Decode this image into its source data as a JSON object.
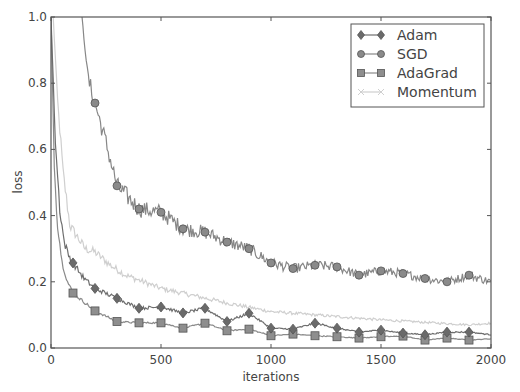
{
  "chart_data": {
    "type": "line",
    "title": "",
    "xlabel": "iterations",
    "ylabel": "loss",
    "xlim": [
      0,
      2000
    ],
    "ylim": [
      0.0,
      1.0
    ],
    "grid": false,
    "legend_position": "upper right",
    "x_ticks": [
      "0",
      "500",
      "1000",
      "1500",
      "2000"
    ],
    "y_ticks": [
      "0.0",
      "0.2",
      "0.4",
      "0.6",
      "0.8",
      "1.0"
    ],
    "marker_every": 100,
    "series": [
      {
        "name": "Adam",
        "marker": "diamond",
        "color": "#6e6e6e",
        "x": [
          0,
          20,
          40,
          60,
          80,
          100,
          150,
          200,
          300,
          400,
          500,
          600,
          700,
          800,
          900,
          1000,
          1100,
          1200,
          1300,
          1400,
          1500,
          1600,
          1700,
          1800,
          1900,
          2000
        ],
        "values": [
          1.0,
          0.62,
          0.42,
          0.32,
          0.28,
          0.257,
          0.21,
          0.18,
          0.15,
          0.12,
          0.124,
          0.106,
          0.12,
          0.08,
          0.105,
          0.06,
          0.057,
          0.075,
          0.06,
          0.048,
          0.054,
          0.045,
          0.04,
          0.048,
          0.048,
          0.04
        ]
      },
      {
        "name": "SGD",
        "marker": "circle",
        "color": "#878787",
        "x": [
          140,
          170,
          200,
          250,
          300,
          400,
          500,
          600,
          700,
          800,
          900,
          1000,
          1100,
          1200,
          1300,
          1400,
          1500,
          1600,
          1700,
          1800,
          1900,
          2000
        ],
        "values": [
          1.0,
          0.81,
          0.74,
          0.62,
          0.49,
          0.42,
          0.41,
          0.36,
          0.35,
          0.32,
          0.3,
          0.257,
          0.24,
          0.25,
          0.245,
          0.22,
          0.233,
          0.225,
          0.21,
          0.2,
          0.22,
          0.2
        ]
      },
      {
        "name": "AdaGrad",
        "marker": "square",
        "color": "#8a8a8a",
        "x": [
          0,
          15,
          27,
          50,
          75,
          100,
          200,
          300,
          400,
          500,
          600,
          700,
          800,
          900,
          1000,
          1100,
          1200,
          1300,
          1400,
          1500,
          1600,
          1700,
          1800,
          1900,
          2000
        ],
        "values": [
          1.0,
          0.55,
          0.39,
          0.26,
          0.2,
          0.166,
          0.112,
          0.08,
          0.076,
          0.076,
          0.06,
          0.075,
          0.052,
          0.057,
          0.037,
          0.042,
          0.037,
          0.034,
          0.03,
          0.034,
          0.036,
          0.024,
          0.03,
          0.024,
          0.028
        ]
      },
      {
        "name": "Momentum",
        "marker": "x",
        "color": "#cfcfcf",
        "x": [
          10,
          30,
          55,
          86,
          155,
          200,
          270,
          340,
          500,
          800,
          1000,
          1500,
          1900,
          2000
        ],
        "values": [
          1.0,
          0.75,
          0.53,
          0.37,
          0.3,
          0.29,
          0.25,
          0.22,
          0.18,
          0.136,
          0.11,
          0.085,
          0.07,
          0.075
        ]
      }
    ]
  },
  "axes": {
    "xlabel": "iterations",
    "ylabel": "loss"
  },
  "legend": {
    "items": [
      {
        "label": "Adam"
      },
      {
        "label": "SGD"
      },
      {
        "label": "AdaGrad"
      },
      {
        "label": "Momentum"
      }
    ]
  }
}
